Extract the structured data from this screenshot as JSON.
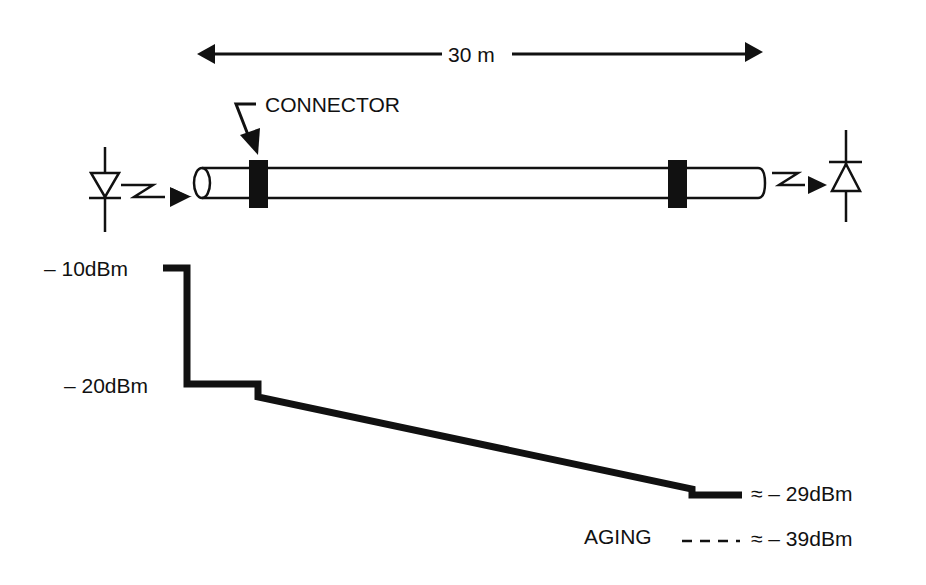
{
  "diagram": {
    "length_label": "30 m",
    "connector_label": "CONNECTOR",
    "source": "LED transmitter",
    "detector": "photodiode receiver",
    "levels": {
      "start": "– 10dBm",
      "after_coupling": "– 20dBm",
      "end": "≈ – 29dBm",
      "aging": "≈ – 39dBm"
    },
    "aging_label": "AGING",
    "colors": {
      "ink": "#111111",
      "background": "#ffffff"
    }
  }
}
